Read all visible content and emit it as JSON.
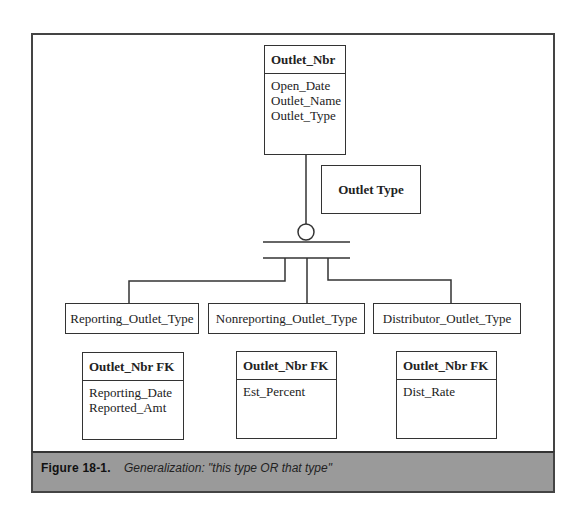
{
  "supertype": {
    "key": "Outlet_Nbr",
    "attributes": [
      "Open_Date",
      "Outlet_Name",
      "Outlet_Type"
    ]
  },
  "discriminator": {
    "label": "Outlet Type"
  },
  "subtypes": [
    {
      "name": "Reporting_Outlet_Type",
      "key": "Outlet_Nbr FK",
      "attributes": [
        "Reporting_Date",
        "Reported_Amt"
      ]
    },
    {
      "name": "Nonreporting_Outlet_Type",
      "key": "Outlet_Nbr FK",
      "attributes": [
        "Est_Percent"
      ]
    },
    {
      "name": "Distributor_Outlet_Type",
      "key": "Outlet_Nbr FK",
      "attributes": [
        "Dist_Rate"
      ]
    }
  ],
  "caption": {
    "label": "Figure  18-1.",
    "text": "Generalization: \"this type OR that type\""
  },
  "colors": {
    "line": "#333333",
    "caption_band": "#9a9a9a",
    "frame": "#444444"
  }
}
